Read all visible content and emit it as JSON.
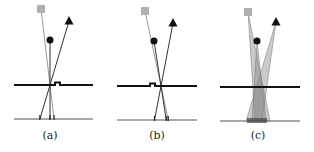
{
  "figure": {
    "panels": [
      {
        "label": "(a)",
        "label_pos": [
          50,
          130
        ],
        "square": [
          41,
          9
        ],
        "circle": [
          50,
          40
        ],
        "triangle": [
          69,
          21
        ],
        "barrier": {
          "y": 85,
          "x1": 14,
          "x2": 93,
          "bump": [
            55,
            60
          ]
        },
        "sensor": {
          "y": 119,
          "x1": 14,
          "x2": 93
        },
        "cross": [
          50,
          85
        ],
        "hits": {
          "square": 53,
          "circle": 49,
          "triangle": 39
        }
      },
      {
        "label": "(b)",
        "label_pos": [
          157,
          130
        ],
        "square": [
          145,
          11
        ],
        "circle": [
          154,
          41
        ],
        "triangle": [
          173,
          23
        ],
        "barrier": {
          "y": 86,
          "x1": 117,
          "x2": 197,
          "bump": [
            150,
            155
          ]
        },
        "sensor": {
          "y": 120,
          "x1": 117,
          "x2": 197
        },
        "cross": [
          161,
          86
        ],
        "hits": {
          "square": 170,
          "circle": 167,
          "triangle": 155
        }
      },
      {
        "label": "(c)",
        "label_pos": [
          258,
          130
        ],
        "square": [
          248,
          12
        ],
        "circle": [
          257,
          41
        ],
        "triangle": [
          276,
          22
        ],
        "barrier": {
          "y": 87,
          "x1": 220,
          "x2": 300,
          "bump": null
        },
        "sensor": {
          "y": 121,
          "x1": 220,
          "x2": 300
        },
        "cones": [
          {
            "apex": [
              248,
              12
            ],
            "base": [
              255,
              270
            ]
          },
          {
            "apex": [
              276,
              22
            ],
            "base": [
              246,
              262
            ]
          },
          {
            "apex": [
              257,
              41
            ],
            "base": [
              252,
              266
            ]
          }
        ]
      }
    ],
    "colors": {
      "square": "#b0b0b0",
      "marker": "#111111",
      "barrier": "#111111",
      "sensor": "#a8a8a8",
      "ray_gray": "#9a9a9a",
      "ray_dark": "#333333",
      "cone": "#8a8a8a"
    }
  }
}
